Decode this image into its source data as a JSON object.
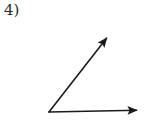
{
  "page": {
    "background_color": "#ffffff",
    "width": 152,
    "height": 123
  },
  "problem": {
    "number_label": "4)",
    "label_color": "#2b2b2b"
  },
  "figure": {
    "name": "angle-diagram",
    "stroke_color": "#1a1a1a",
    "stroke_width": 1.6,
    "vertex": {
      "x": 49,
      "y": 112
    },
    "rays": [
      {
        "name": "horizontal-ray",
        "from": {
          "x": 49,
          "y": 112
        },
        "to": {
          "x": 147,
          "y": 110
        },
        "arrowhead": "filled-triangle",
        "direction": "right"
      },
      {
        "name": "diagonal-ray",
        "from": {
          "x": 49,
          "y": 112
        },
        "to": {
          "x": 113,
          "y": 30
        },
        "arrowhead": "filled-triangle",
        "direction": "up-right"
      }
    ],
    "angle_degrees": 50
  },
  "chart_data": {
    "type": "diagram",
    "title": "4)",
    "shape": "angle",
    "vertex": [
      49,
      112
    ],
    "ray_endpoints": [
      [
        147,
        110
      ],
      [
        113,
        30
      ]
    ],
    "angle_degrees": 50,
    "annotations": []
  }
}
